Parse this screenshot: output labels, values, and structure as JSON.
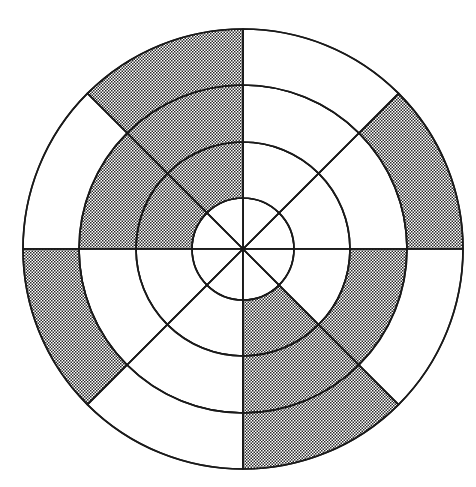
{
  "figure": {
    "background_color": "#ffffff",
    "line_color": "#1a1a1a",
    "shade_fill_color": "#8c8c8c",
    "shade_style": "checkerboard-stipple",
    "width_px": 476,
    "height_px": 487
  },
  "chart_data": {
    "type": "pie",
    "subtitle": "",
    "xlabel": "",
    "ylabel": "",
    "center_x": 243,
    "center_y": 249,
    "sector_count": 8,
    "sector_angle_degrees": 45,
    "ring_count": 4,
    "ring_radii_px": [
      51,
      107,
      164,
      220
    ],
    "grid": true,
    "legend": "none",
    "angle_convention": "degrees counterclockwise from positive x-axis (east)",
    "sector_labels": [
      "0-45",
      "45-90",
      "90-135",
      "135-180",
      "180-225",
      "225-270",
      "270-315",
      "315-360"
    ],
    "rings": [
      {
        "ring_index": 1,
        "name": "inner-disc",
        "inner_radius": 0,
        "outer_radius": 51,
        "shaded": [
          false,
          false,
          false,
          false,
          false,
          false,
          false,
          false
        ],
        "shaded_count": 0
      },
      {
        "ring_index": 2,
        "name": "ring-2",
        "inner_radius": 51,
        "outer_radius": 107,
        "shaded": [
          false,
          false,
          true,
          true,
          false,
          false,
          true,
          false
        ],
        "shaded_count": 3
      },
      {
        "ring_index": 3,
        "name": "ring-3",
        "inner_radius": 107,
        "outer_radius": 164,
        "shaded": [
          false,
          false,
          true,
          true,
          false,
          false,
          true,
          true
        ],
        "shaded_count": 4
      },
      {
        "ring_index": 4,
        "name": "ring-4-outer",
        "inner_radius": 164,
        "outer_radius": 220,
        "shaded": [
          true,
          false,
          true,
          false,
          true,
          false,
          true,
          false
        ],
        "shaded_count": 4
      }
    ],
    "total_cells": 32,
    "shaded_cells": 11,
    "values": [
      0,
      3,
      4,
      4
    ],
    "categories": [
      "inner-disc",
      "ring-2",
      "ring-3",
      "ring-4-outer"
    ]
  }
}
